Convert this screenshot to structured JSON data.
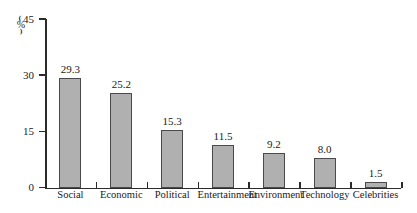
{
  "chart_data": {
    "type": "bar",
    "title": "",
    "subtitle": "",
    "xlabel": "",
    "ylabel": "(%)",
    "unit_label": "%",
    "categories": [
      "Social",
      "Economic",
      "Political",
      "Entertainment",
      "Environment",
      "Technology",
      "Celebrities"
    ],
    "values": [
      29.3,
      25.2,
      15.3,
      11.5,
      9.2,
      8.0,
      1.5
    ],
    "value_labels": [
      "29.3",
      "25.2",
      "15.3",
      "11.5",
      "9.2",
      "8.0",
      "1.5"
    ],
    "ylim": [
      0,
      45
    ],
    "yticks": [
      0,
      15,
      30,
      45
    ],
    "ytick_labels": [
      "0",
      "15",
      "30",
      "45"
    ],
    "grid": false,
    "legend": null,
    "bar_fill_color": "#b0b0b0",
    "bar_edge_color": "#4a4a4a",
    "axis_color": "#2b2b2b",
    "background_color": "#ffffff"
  }
}
